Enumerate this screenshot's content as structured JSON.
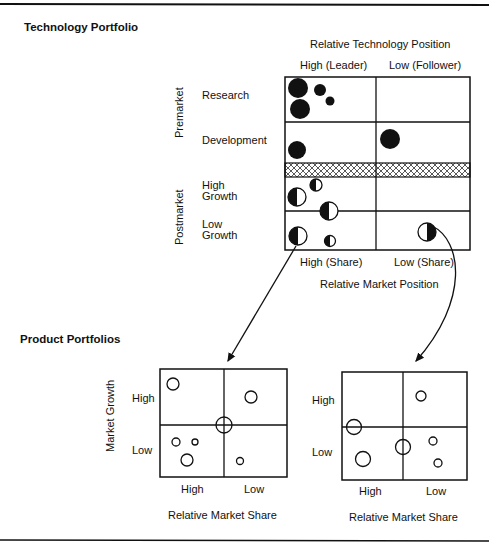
{
  "colors": {
    "ink": "#111111",
    "paper": "#ffffff"
  },
  "rules": {
    "top_y": 4,
    "bottom_y": 540
  },
  "technology_portfolio": {
    "title": "Technology Portfolio",
    "column_axis_title": "Relative Technology Position",
    "column_headers": [
      "High (Leader)",
      "Low (Follower)"
    ],
    "row_groups": [
      {
        "label": "Premarket",
        "rows": [
          "Research",
          "Development"
        ]
      },
      {
        "label": "Postmarket",
        "rows": [
          [
            "High",
            "Growth"
          ],
          [
            "Low",
            "Growth"
          ]
        ]
      }
    ],
    "bottom_headers": [
      "High (Share)",
      "Low (Share)"
    ],
    "bottom_axis_title": "Relative Market Position",
    "grid": {
      "x0": 285,
      "x1": 376,
      "x2": 470,
      "y0": 77,
      "y1": 122,
      "y_hatch_top": 163,
      "y_hatch_bottom": 177,
      "y2": 211,
      "y3": 250
    },
    "bubbles": [
      {
        "cell": "Research/High",
        "cx": 298,
        "cy": 88,
        "r": 10,
        "fill": "full"
      },
      {
        "cell": "Research/High",
        "cx": 320,
        "cy": 90,
        "r": 6,
        "fill": "full"
      },
      {
        "cell": "Research/High",
        "cx": 330,
        "cy": 101,
        "r": 4.5,
        "fill": "full"
      },
      {
        "cell": "Research/High",
        "cx": 300,
        "cy": 109,
        "r": 10,
        "fill": "full"
      },
      {
        "cell": "Development/High",
        "cx": 297,
        "cy": 150,
        "r": 9,
        "fill": "full"
      },
      {
        "cell": "Development/Low",
        "cx": 390,
        "cy": 139,
        "r": 10,
        "fill": "full"
      },
      {
        "cell": "HighGrowth/High",
        "cx": 316,
        "cy": 185,
        "r": 6,
        "fill": "half"
      },
      {
        "cell": "HighGrowth/High",
        "cx": 297,
        "cy": 197,
        "r": 9,
        "fill": "half"
      },
      {
        "cell": "HighGrowth/High",
        "cx": 329,
        "cy": 211,
        "r": 9,
        "fill": "half"
      },
      {
        "cell": "LowGrowth/High",
        "cx": 298,
        "cy": 236,
        "r": 9,
        "fill": "half"
      },
      {
        "cell": "LowGrowth/High",
        "cx": 330,
        "cy": 241,
        "r": 5.5,
        "fill": "half"
      },
      {
        "cell": "LowGrowth/Low",
        "cx": 427,
        "cy": 232,
        "r": 9,
        "fill": "half-reverse"
      }
    ],
    "legend_note": "Filled = technology (premarket); half-filled = technology in marketed products (postmarket)"
  },
  "arrows": [
    {
      "from": "LowGrowth/High bubble",
      "to": "Product Portfolio 1",
      "path": "M 296 246 L 228 361"
    },
    {
      "from": "LowGrowth/Low bubble",
      "to": "Product Portfolio 2",
      "path": "M 432 226 C 462 240 470 300 416 361"
    }
  ],
  "product_portfolios": {
    "title": "Product Portfolios",
    "y_axis_title": "Market Growth",
    "row_labels": [
      "High",
      "Low"
    ],
    "column_labels": [
      "High",
      "Low"
    ],
    "x_axis_title": "Relative Market Share",
    "matrices": [
      {
        "name": "Product Portfolio 1",
        "grid": {
          "x0": 160,
          "xm": 224,
          "x1": 287,
          "y0": 369,
          "ym": 425,
          "y1": 477
        },
        "bubbles": [
          {
            "cx": 173,
            "cy": 384,
            "r": 6
          },
          {
            "cx": 251,
            "cy": 397,
            "r": 6
          },
          {
            "cx": 224,
            "cy": 425,
            "r": 8
          },
          {
            "cx": 176,
            "cy": 442,
            "r": 4
          },
          {
            "cx": 195,
            "cy": 442,
            "r": 3
          },
          {
            "cx": 187,
            "cy": 460,
            "r": 6
          },
          {
            "cx": 240,
            "cy": 461,
            "r": 3.5
          }
        ]
      },
      {
        "name": "Product Portfolio 2",
        "grid": {
          "x0": 342,
          "xm": 403,
          "x1": 467,
          "y0": 372,
          "ym": 427,
          "y1": 480
        },
        "bubbles": [
          {
            "cx": 421,
            "cy": 396,
            "r": 5
          },
          {
            "cx": 354,
            "cy": 427,
            "r": 7.5
          },
          {
            "cx": 403,
            "cy": 447,
            "r": 7.5
          },
          {
            "cx": 363,
            "cy": 459,
            "r": 7.5
          },
          {
            "cx": 433,
            "cy": 441,
            "r": 4
          },
          {
            "cx": 438,
            "cy": 463,
            "r": 4
          }
        ]
      }
    ]
  }
}
